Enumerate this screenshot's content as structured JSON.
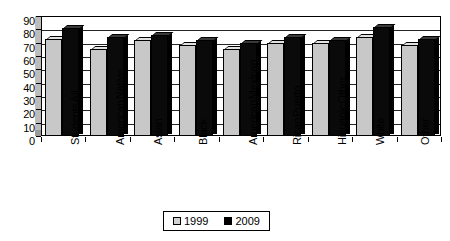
{
  "chart_data": {
    "type": "bar",
    "title": "",
    "subtitle": "",
    "xlabel": "",
    "ylabel": "",
    "ylim": [
      0,
      90
    ],
    "y_ticks": [
      0,
      10,
      20,
      30,
      40,
      50,
      60,
      70,
      80,
      90
    ],
    "grid": true,
    "legend_position": "bottom",
    "categories": [
      "All Students",
      "Native American",
      "Asian",
      "Black",
      "Mexican American",
      "Puerto Rican",
      "Other Hispanic",
      "White",
      "Other"
    ],
    "category_lines": [
      [
        "All",
        "Students"
      ],
      [
        "Native",
        "American"
      ],
      [
        "Asian"
      ],
      [
        "Black"
      ],
      [
        "Mexican",
        "American"
      ],
      [
        "Puerto",
        "Rican"
      ],
      [
        "Other",
        "Hispanic"
      ],
      [
        "White"
      ],
      [
        "Other"
      ]
    ],
    "series": [
      {
        "name": "1999",
        "color": "#c8c8c8",
        "values": [
          73,
          65,
          72,
          68,
          65,
          70,
          70,
          74,
          68
        ]
      },
      {
        "name": "2009",
        "color": "#000000",
        "values": [
          81,
          74,
          76,
          72,
          70,
          74,
          72,
          82,
          73
        ]
      }
    ]
  },
  "legend": {
    "items": [
      {
        "label": "1999",
        "swatch": "light-gray-square"
      },
      {
        "label": "2009",
        "swatch": "black-square"
      }
    ]
  },
  "axis": {
    "y_labels": [
      "90",
      "80",
      "70",
      "60",
      "50",
      "40",
      "30",
      "20",
      "10",
      "0"
    ]
  }
}
